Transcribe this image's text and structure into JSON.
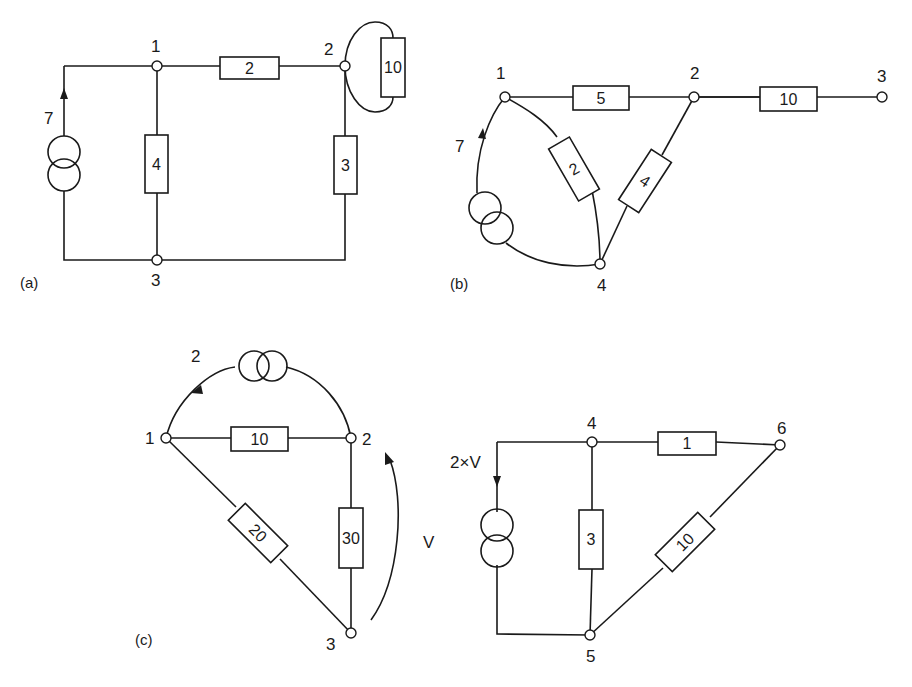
{
  "figure": {
    "circuits": [
      {
        "id": "a",
        "caption": "(a)",
        "nodes": [
          "1",
          "2",
          "3"
        ],
        "current_source": {
          "value": "7",
          "from": "3",
          "to": "1"
        },
        "resistors": [
          {
            "value": "2",
            "between": [
              "1",
              "2"
            ]
          },
          {
            "value": "4",
            "between": [
              "1",
              "3"
            ]
          },
          {
            "value": "3",
            "between": [
              "2",
              "3"
            ]
          },
          {
            "value": "10",
            "between": [
              "2",
              "2"
            ]
          }
        ]
      },
      {
        "id": "b",
        "caption": "(b)",
        "nodes": [
          "1",
          "2",
          "3",
          "4"
        ],
        "current_source": {
          "value": "7",
          "from": "4",
          "to": "1"
        },
        "resistors": [
          {
            "value": "5",
            "between": [
              "1",
              "2"
            ]
          },
          {
            "value": "10",
            "between": [
              "2",
              "3"
            ]
          },
          {
            "value": "2",
            "between": [
              "1",
              "4"
            ]
          },
          {
            "value": "4",
            "between": [
              "2",
              "4"
            ]
          }
        ]
      },
      {
        "id": "c",
        "caption": "(c)",
        "nodes": [
          "1",
          "2",
          "3",
          "4",
          "5",
          "6"
        ],
        "current_source": {
          "value": "2",
          "from": "2",
          "to": "1"
        },
        "dependent_source": {
          "value": "2×V",
          "from": "4",
          "to": "5"
        },
        "voltage_label": "V",
        "resistors": [
          {
            "value": "10",
            "between": [
              "1",
              "2"
            ]
          },
          {
            "value": "20",
            "between": [
              "1",
              "3"
            ]
          },
          {
            "value": "30",
            "between": [
              "2",
              "3"
            ]
          },
          {
            "value": "1",
            "between": [
              "4",
              "6"
            ]
          },
          {
            "value": "3",
            "between": [
              "4",
              "5"
            ]
          },
          {
            "value": "10",
            "between": [
              "5",
              "6"
            ]
          }
        ]
      }
    ]
  }
}
